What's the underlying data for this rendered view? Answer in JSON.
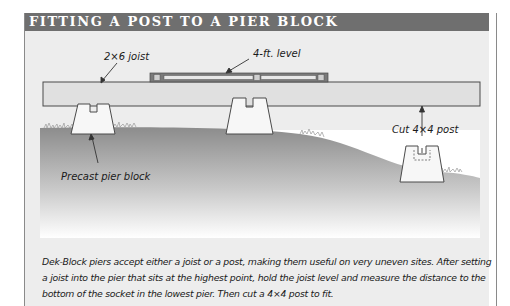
{
  "header": {
    "title": "FITTING A POST TO A PIER BLOCK"
  },
  "labels": {
    "joist": "2×6 joist",
    "level": "4-ft. level",
    "post": "Cut 4×4 post",
    "pier": "Precast pier block"
  },
  "caption": "Dek-Block piers accept either a joist or a post, making them useful on very uneven sites. After setting a joist into the pier that sits at the highest point, hold the joist level and measure the distance to the bottom of the socket in the lowest pier. Then cut a 4×4 post to fit.",
  "colors": {
    "header_bg": "#6f6f6f",
    "panel_bg": "#ededed",
    "joist_fill": "#e2e2e2",
    "ground_dark": "#8f8f8f",
    "outline": "#4a4a4a"
  }
}
